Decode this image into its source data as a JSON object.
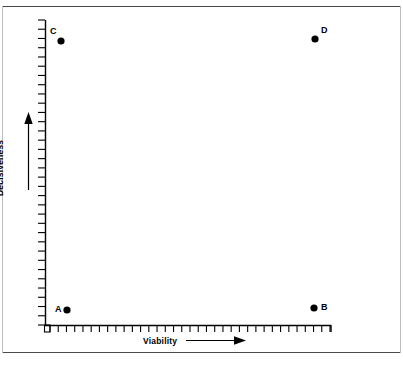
{
  "figure": {
    "background": "#ffffff",
    "ink": "#000000",
    "frame_color": "#4a4a4a"
  },
  "axes": {
    "x": {
      "title": "Viability",
      "arrow": "right-arrow",
      "tick_count": 34,
      "start_px": 45,
      "end_px": 331,
      "baseline_px": 325
    },
    "y": {
      "title": "Decisiveness",
      "arrow": "up-arrow",
      "tick_count": 33,
      "top_px": 20,
      "bottom_px": 325,
      "baseline_px": 45
    }
  },
  "points": [
    {
      "label": "A",
      "x_px": 67,
      "y_px": 310,
      "label_x_px": 55,
      "label_y_px": 305,
      "quadrant": "low-viability / low-decisiveness"
    },
    {
      "label": "B",
      "x_px": 314,
      "y_px": 308,
      "label_x_px": 321,
      "label_y_px": 303,
      "quadrant": "high-viability / low-decisiveness"
    },
    {
      "label": "C",
      "x_px": 61,
      "y_px": 41,
      "label_x_px": 50,
      "label_y_px": 27,
      "quadrant": "low-viability / high-decisiveness"
    },
    {
      "label": "D",
      "x_px": 315,
      "y_px": 39,
      "label_x_px": 321,
      "label_y_px": 26,
      "quadrant": "high-viability / high-decisiveness"
    }
  ],
  "chart_data": {
    "type": "scatter",
    "title": "",
    "xlabel": "Viability",
    "ylabel": "Decisiveness",
    "xlim": [
      0,
      100
    ],
    "ylim": [
      0,
      100
    ],
    "grid": false,
    "legend": "none",
    "axis_tick_labels": {
      "x": [],
      "y": []
    },
    "annotations": [
      "Viability axis increases to the right (arrow)",
      "Decisiveness axis increases upward (arrow)"
    ],
    "series": [
      {
        "name": "Options",
        "point_labels": [
          "A",
          "B",
          "C",
          "D"
        ],
        "x": [
          8,
          94,
          6,
          95
        ],
        "y": [
          5,
          6,
          94,
          95
        ]
      }
    ]
  }
}
